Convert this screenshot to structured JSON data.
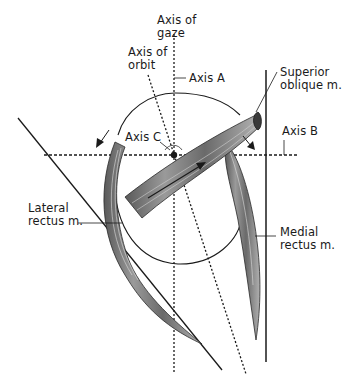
{
  "diagram": {
    "type": "anatomical-illustration",
    "labels": {
      "axis_of_gaze": "Axis of\ngaze",
      "axis_of_orbit": "Axis of\norbit",
      "axis_a": "Axis A",
      "axis_b": "Axis B",
      "axis_c": "Axis C",
      "superior_oblique": "Superior\noblique m.",
      "lateral_rectus": "Lateral\nrectus m.",
      "medial_rectus": "Medial\nrectus m."
    },
    "colors": {
      "line": "#1a1a1a",
      "muscle_fill": "#8a8a8a",
      "muscle_dark": "#3a3a3a",
      "background": "#ffffff"
    }
  }
}
